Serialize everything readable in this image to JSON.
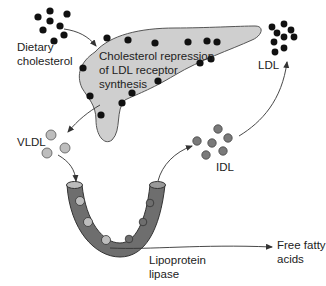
{
  "labels": {
    "dietary": [
      "Dietary",
      "cholesterol"
    ],
    "liver": [
      "Cholesterol repression",
      "of LDL receptor",
      "synthesis"
    ],
    "ldl": "LDL",
    "vldl": "VLDL",
    "idl": "IDL",
    "lipase": [
      "Lipoprotein",
      "lipase"
    ],
    "ffa": [
      "Free fatty",
      "acids"
    ]
  },
  "colors": {
    "liver_fill": "#cfcfcf",
    "vessel_fill": "#6e6e6e",
    "black_dot": "#111111",
    "vldl_dot": "#bdbdbd",
    "idl_dot": "#7a7a7a",
    "arrow": "#333333"
  }
}
